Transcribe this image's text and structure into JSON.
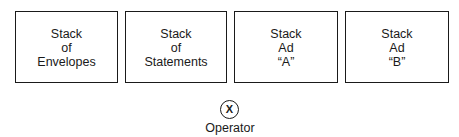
{
  "boxes": [
    {
      "lines": [
        "Stack",
        "of",
        "Envelopes"
      ]
    },
    {
      "lines": [
        "Stack",
        "of",
        "Statements"
      ]
    },
    {
      "lines": [
        "Stack",
        "Ad",
        "“A”"
      ]
    },
    {
      "lines": [
        "Stack",
        "Ad",
        "“B”"
      ]
    }
  ],
  "operator": {
    "symbol": "X",
    "label": "Operator"
  }
}
